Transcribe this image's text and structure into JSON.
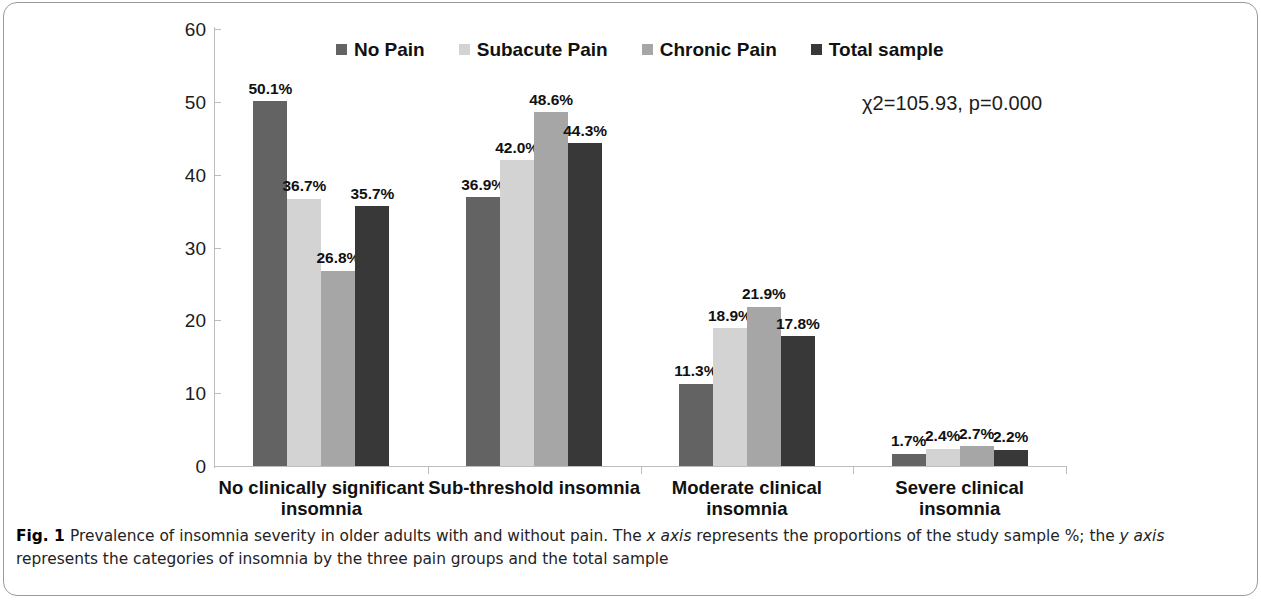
{
  "figure": {
    "caption_label": "Fig. 1",
    "caption_text_1": "Prevalence of insomnia severity in older adults with and without pain. The ",
    "caption_axis_x": "x axis",
    "caption_text_2": " represents the proportions of the study sample %; the ",
    "caption_axis_y": "y axis",
    "caption_text_3": " represents the categories of insomnia by the three pain groups and the total sample"
  },
  "annotation": {
    "statistics": "χ2=105.93,  p=0.000"
  },
  "legend": {
    "position": "top-center",
    "items": [
      {
        "label": "No Pain",
        "color": "#636363",
        "icon": "square-swatch"
      },
      {
        "label": "Subacute Pain",
        "color": "#d3d3d3",
        "icon": "square-swatch"
      },
      {
        "label": "Chronic Pain",
        "color": "#a6a6a6",
        "icon": "square-swatch"
      },
      {
        "label": "Total sample",
        "color": "#383838",
        "icon": "square-swatch"
      }
    ]
  },
  "axes": {
    "y_ticks": [
      "0",
      "10",
      "20",
      "30",
      "40",
      "50",
      "60"
    ],
    "x_categories": [
      "No clinically significant insomnia",
      "Sub-threshold insomnia",
      "Moderate clinical insomnia",
      "Severe clinical insomnia"
    ]
  },
  "chart_data": {
    "type": "bar",
    "title": "",
    "subtitle": "",
    "xlabel": "",
    "ylabel": "",
    "ylim": [
      0,
      60
    ],
    "ytick_step": 10,
    "grid": false,
    "legend_position": "top-center",
    "annotation": "χ2=105.93, p=0.000",
    "categories": [
      "No clinically significant insomnia",
      "Sub-threshold insomnia",
      "Moderate clinical insomnia",
      "Severe clinical insomnia"
    ],
    "series": [
      {
        "name": "No Pain",
        "color": "#636363",
        "values": [
          50.1,
          36.9,
          11.3,
          1.7
        ],
        "labels": [
          "50.1%",
          "36.9%",
          "11.3%",
          "1.7%"
        ]
      },
      {
        "name": "Subacute Pain",
        "color": "#d3d3d3",
        "values": [
          36.7,
          42.0,
          18.9,
          2.4
        ],
        "labels": [
          "36.7%",
          "42.0%",
          "18.9%",
          "2.4%"
        ]
      },
      {
        "name": "Chronic Pain",
        "color": "#a6a6a6",
        "values": [
          26.8,
          48.6,
          21.9,
          2.7
        ],
        "labels": [
          "26.8%",
          "48.6%",
          "21.9%",
          "2.7%"
        ]
      },
      {
        "name": "Total sample",
        "color": "#383838",
        "values": [
          35.7,
          44.3,
          17.8,
          2.2
        ],
        "labels": [
          "35.7%",
          "44.3%",
          "17.8%",
          "2.2%"
        ]
      }
    ]
  }
}
